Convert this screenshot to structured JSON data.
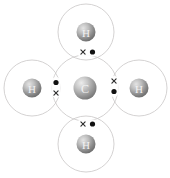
{
  "diagram": {
    "molecule_formula": "CH4",
    "background_color": "#ffffff",
    "shell_stroke_color": "#c9c6c6",
    "dot_color": "#111111",
    "cross_color": "#2b2b2b",
    "sphere_color_light": "#d8d8d8",
    "sphere_color_dark": "#6f6f6f",
    "label_color": "#f2f2f2",
    "canvas": {
      "width": 170,
      "height": 178
    },
    "atoms": [
      {
        "id": "carbon-center",
        "element": "C",
        "label": "C",
        "role": "central-atom",
        "cx": 85,
        "cy": 88,
        "sphere_r": 11.5,
        "shell_r": 33
      },
      {
        "id": "hydrogen-top",
        "element": "H",
        "label": "H",
        "role": "bonded-atom",
        "cx": 86,
        "cy": 32,
        "sphere_r": 9.5,
        "shell_r": 28
      },
      {
        "id": "hydrogen-left",
        "element": "H",
        "label": "H",
        "role": "bonded-atom",
        "cx": 32,
        "cy": 88,
        "sphere_r": 9.5,
        "shell_r": 28
      },
      {
        "id": "hydrogen-right",
        "element": "H",
        "label": "H",
        "role": "bonded-atom",
        "cx": 139,
        "cy": 88,
        "sphere_r": 9.5,
        "shell_r": 28
      },
      {
        "id": "hydrogen-bottom",
        "element": "H",
        "label": "H",
        "role": "bonded-atom",
        "cx": 86,
        "cy": 144,
        "sphere_r": 9.5,
        "shell_r": 28
      }
    ],
    "bond_pairs": [
      {
        "id": "bond-pair-top",
        "bond": "C-H top",
        "cross": {
          "x": 83,
          "y": 52,
          "size": 3
        },
        "dot": {
          "x": 92.5,
          "y": 52,
          "r": 2.6
        }
      },
      {
        "id": "bond-pair-left",
        "bond": "C-H left",
        "cross": {
          "x": 56,
          "y": 93,
          "size": 3
        },
        "dot": {
          "x": 56,
          "y": 82.5,
          "r": 2.6
        }
      },
      {
        "id": "bond-pair-right",
        "bond": "C-H right",
        "cross": {
          "x": 114,
          "y": 81,
          "size": 3
        },
        "dot": {
          "x": 114,
          "y": 91.5,
          "r": 2.6
        }
      },
      {
        "id": "bond-pair-bottom",
        "bond": "C-H bottom",
        "cross": {
          "x": 83,
          "y": 124,
          "size": 3
        },
        "dot": {
          "x": 92.5,
          "y": 124,
          "r": 2.6
        }
      }
    ]
  }
}
